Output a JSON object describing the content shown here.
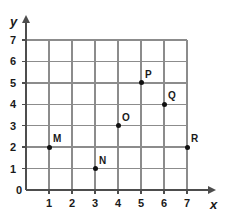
{
  "chart_data": {
    "type": "scatter",
    "title": "",
    "xlabel": "x",
    "ylabel": "y",
    "xlim": [
      0,
      7
    ],
    "ylim": [
      0,
      7
    ],
    "grid": true,
    "legend": "none",
    "xticks": [
      "0",
      "1",
      "2",
      "3",
      "4",
      "5",
      "6",
      "7"
    ],
    "yticks": [
      "0",
      "1",
      "2",
      "3",
      "4",
      "5",
      "6",
      "7"
    ],
    "xtick_values": [
      0,
      1,
      2,
      3,
      4,
      5,
      6,
      7
    ],
    "ytick_values": [
      0,
      1,
      2,
      3,
      4,
      5,
      6,
      7
    ],
    "points": [
      {
        "label": "M",
        "x": 1,
        "y": 2,
        "label_pos": "up-right"
      },
      {
        "label": "N",
        "x": 3,
        "y": 1,
        "label_pos": "up-right"
      },
      {
        "label": "O",
        "x": 4,
        "y": 3,
        "label_pos": "up-right"
      },
      {
        "label": "P",
        "x": 5,
        "y": 5,
        "label_pos": "up-right"
      },
      {
        "label": "Q",
        "x": 6,
        "y": 4,
        "label_pos": "up-right"
      },
      {
        "label": "R",
        "x": 7,
        "y": 2,
        "label_pos": "up-right"
      }
    ],
    "colors": {
      "background": "#ffffff",
      "grid": "#8c8c8c",
      "axis": "#4d4d4d",
      "point": "#111111",
      "text": "#1a1a1a"
    }
  }
}
